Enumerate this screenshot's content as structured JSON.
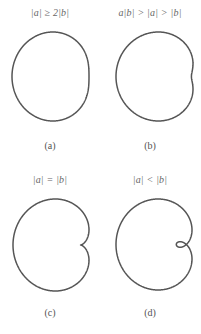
{
  "figure": {
    "panels": [
      {
        "id": "a",
        "condition": "|a| ≥ 2|b|",
        "caption": "(a)",
        "params": {
          "a": 2.1,
          "b": 1.0
        },
        "bbox": [
          12,
          32,
          89,
          121
        ]
      },
      {
        "id": "b",
        "condition": "a|b| > |a| > |b|",
        "caption": "(b)",
        "params": {
          "a": 1.5,
          "b": 1.0
        },
        "bbox": [
          16,
          32,
          93,
          121
        ]
      },
      {
        "id": "c",
        "condition": "|a| = |b|",
        "caption": "(c)",
        "params": {
          "a": 1.0,
          "b": 1.0
        },
        "bbox": [
          13,
          32,
          89,
          124
        ]
      },
      {
        "id": "d",
        "condition": "|a| < |b|",
        "caption": "(d)",
        "params": {
          "a": 0.75,
          "b": 1.0
        },
        "bbox": [
          16,
          32,
          92,
          123
        ]
      }
    ],
    "stroke_color": "#555555"
  }
}
